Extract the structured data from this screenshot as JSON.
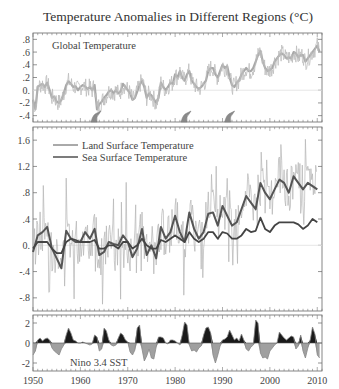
{
  "chart_data": [
    {
      "type": "line",
      "panel": "top",
      "title": "Temperature Anomalies in Different Regions (°C)",
      "label": "Global Temperature",
      "xlim": [
        1950,
        2011
      ],
      "ylim": [
        -0.5,
        0.9
      ],
      "yticks": [
        0.8,
        0.6,
        0.4,
        0.2,
        0.0,
        -0.2,
        -0.4
      ],
      "ytick_labels": [
        ".8",
        ".6",
        ".4",
        ".2",
        "0.",
        "-.2",
        "-.4"
      ],
      "zero_line": true,
      "volcano_markers": [
        1963.3,
        1982.3,
        1991.5
      ],
      "series": [
        {
          "name": "Global Temperature",
          "color": "#a8a8a8",
          "x": [
            1950,
            1950.5,
            1951,
            1951.5,
            1952,
            1952.5,
            1953,
            1953.5,
            1954,
            1954.5,
            1955,
            1955.5,
            1956,
            1956.5,
            1957,
            1957.5,
            1958,
            1958.5,
            1959,
            1959.5,
            1960,
            1960.5,
            1961,
            1961.5,
            1962,
            1962.5,
            1963,
            1963.5,
            1964,
            1964.5,
            1965,
            1965.5,
            1966,
            1966.5,
            1967,
            1967.5,
            1968,
            1968.5,
            1969,
            1969.5,
            1970,
            1970.5,
            1971,
            1971.5,
            1972,
            1972.5,
            1973,
            1973.5,
            1974,
            1974.5,
            1975,
            1975.5,
            1976,
            1976.5,
            1977,
            1977.5,
            1978,
            1978.5,
            1979,
            1979.5,
            1980,
            1980.5,
            1981,
            1981.5,
            1982,
            1982.5,
            1983,
            1983.5,
            1984,
            1984.5,
            1985,
            1985.5,
            1986,
            1986.5,
            1987,
            1987.5,
            1988,
            1988.5,
            1989,
            1989.5,
            1990,
            1990.5,
            1991,
            1991.5,
            1992,
            1992.5,
            1993,
            1993.5,
            1994,
            1994.5,
            1995,
            1995.5,
            1996,
            1996.5,
            1997,
            1997.5,
            1998,
            1998.5,
            1999,
            1999.5,
            2000,
            2000.5,
            2001,
            2001.5,
            2002,
            2002.5,
            2003,
            2003.5,
            2004,
            2004.5,
            2005,
            2005.5,
            2006,
            2006.5,
            2007,
            2007.5,
            2008,
            2008.5,
            2009,
            2009.5,
            2010,
            2010.5
          ],
          "values": [
            -0.15,
            -0.3,
            0.05,
            0.08,
            0.1,
            0.05,
            0.12,
            0.0,
            -0.12,
            -0.1,
            -0.18,
            -0.2,
            -0.15,
            -0.05,
            0.08,
            0.14,
            0.1,
            0.05,
            0.06,
            0.0,
            0.05,
            0.08,
            0.06,
            0.02,
            0.05,
            0.0,
            0.08,
            -0.3,
            -0.22,
            -0.18,
            -0.12,
            -0.08,
            -0.02,
            0.0,
            -0.05,
            0.0,
            -0.05,
            -0.02,
            0.1,
            0.05,
            0.0,
            -0.05,
            -0.15,
            -0.12,
            -0.02,
            0.08,
            0.15,
            0.05,
            -0.12,
            -0.05,
            -0.08,
            -0.14,
            -0.2,
            -0.12,
            0.12,
            0.05,
            0.0,
            0.05,
            0.12,
            0.1,
            0.25,
            0.2,
            0.3,
            0.2,
            0.15,
            0.25,
            0.3,
            0.15,
            0.1,
            0.05,
            0.02,
            0.05,
            0.1,
            0.15,
            0.3,
            0.35,
            0.35,
            0.25,
            0.2,
            0.3,
            0.4,
            0.35,
            0.38,
            0.2,
            0.08,
            0.05,
            0.12,
            0.15,
            0.25,
            0.3,
            0.35,
            0.3,
            0.3,
            0.35,
            0.45,
            0.55,
            0.62,
            0.45,
            0.35,
            0.3,
            0.32,
            0.35,
            0.45,
            0.5,
            0.55,
            0.58,
            0.55,
            0.5,
            0.52,
            0.5,
            0.6,
            0.58,
            0.52,
            0.55,
            0.55,
            0.45,
            0.5,
            0.55,
            0.6,
            0.65,
            0.7,
            0.6
          ]
        }
      ]
    },
    {
      "type": "line",
      "panel": "middle",
      "xlim": [
        1950,
        2011
      ],
      "ylim": [
        -1.0,
        1.8
      ],
      "yticks": [
        1.6,
        1.2,
        0.8,
        0.4,
        0.0,
        -0.4,
        -0.8
      ],
      "ytick_labels": [
        "1.6",
        "1.2",
        ".8",
        ".4",
        "0.",
        "-.4",
        "-.8"
      ],
      "zero_line": true,
      "legend": {
        "placement": "top-left",
        "entries": [
          "Land Surface Temperature",
          "Sea Surface Temperature"
        ]
      },
      "series": [
        {
          "name": "Land Surface Temperature (smoothed)",
          "color": "#555555",
          "x": [
            1950,
            1951,
            1952,
            1953,
            1954,
            1955,
            1956,
            1957,
            1958,
            1959,
            1960,
            1961,
            1962,
            1963,
            1964,
            1965,
            1966,
            1967,
            1968,
            1969,
            1970,
            1971,
            1972,
            1973,
            1974,
            1975,
            1976,
            1977,
            1978,
            1979,
            1980,
            1981,
            1982,
            1983,
            1984,
            1985,
            1986,
            1987,
            1988,
            1989,
            1990,
            1991,
            1992,
            1993,
            1994,
            1995,
            1996,
            1997,
            1998,
            1999,
            2000,
            2001,
            2002,
            2003,
            2004,
            2005,
            2006,
            2007,
            2008,
            2009,
            2010
          ],
          "values": [
            -0.1,
            0.15,
            0.2,
            0.28,
            -0.05,
            -0.2,
            -0.35,
            0.22,
            0.1,
            0.05,
            0.05,
            0.2,
            0.1,
            0.25,
            -0.15,
            -0.1,
            0.05,
            0.02,
            0.0,
            0.15,
            0.05,
            -0.18,
            -0.05,
            0.25,
            -0.15,
            0.0,
            -0.2,
            0.28,
            0.1,
            0.2,
            0.45,
            0.2,
            0.05,
            0.5,
            0.25,
            0.1,
            0.2,
            0.48,
            0.5,
            0.3,
            0.6,
            0.45,
            0.3,
            0.35,
            0.55,
            0.75,
            0.65,
            0.55,
            0.95,
            0.8,
            0.7,
            0.85,
            1.0,
            0.95,
            0.8,
            1.05,
            0.95,
            0.85,
            0.95,
            0.9,
            0.85
          ]
        },
        {
          "name": "Sea Surface Temperature (smoothed)",
          "color": "#444444",
          "x": [
            1950,
            1951,
            1952,
            1953,
            1954,
            1955,
            1956,
            1957,
            1958,
            1959,
            1960,
            1961,
            1962,
            1963,
            1964,
            1965,
            1966,
            1967,
            1968,
            1969,
            1970,
            1971,
            1972,
            1973,
            1974,
            1975,
            1976,
            1977,
            1978,
            1979,
            1980,
            1981,
            1982,
            1983,
            1984,
            1985,
            1986,
            1987,
            1988,
            1989,
            1990,
            1991,
            1992,
            1993,
            1994,
            1995,
            1996,
            1997,
            1998,
            1999,
            2000,
            2001,
            2002,
            2003,
            2004,
            2005,
            2006,
            2007,
            2008,
            2009,
            2010
          ],
          "values": [
            -0.05,
            0.05,
            0.05,
            0.05,
            -0.05,
            -0.12,
            -0.12,
            0.05,
            0.1,
            0.08,
            0.05,
            0.05,
            0.05,
            0.08,
            -0.05,
            -0.05,
            0.0,
            0.0,
            -0.05,
            0.05,
            0.05,
            -0.05,
            0.0,
            0.1,
            0.0,
            -0.05,
            -0.05,
            0.08,
            0.05,
            0.1,
            0.15,
            0.1,
            0.05,
            0.2,
            0.1,
            0.05,
            0.1,
            0.2,
            0.2,
            0.1,
            0.2,
            0.18,
            0.1,
            0.1,
            0.15,
            0.25,
            0.2,
            0.22,
            0.42,
            0.25,
            0.2,
            0.3,
            0.35,
            0.35,
            0.35,
            0.35,
            0.32,
            0.25,
            0.3,
            0.4,
            0.35
          ]
        }
      ]
    },
    {
      "type": "area",
      "panel": "bottom",
      "label": "Nino 3.4 SST",
      "xlim": [
        1950,
        2011
      ],
      "ylim": [
        -2.8,
        2.8
      ],
      "yticks": [
        2,
        0,
        -2
      ],
      "ytick_labels": [
        "2",
        "0",
        "-2"
      ],
      "xticks": [
        1950,
        1960,
        1970,
        1980,
        1990,
        2000,
        2010
      ],
      "xtick_labels": [
        "1950",
        "1960",
        "1970",
        "1980",
        "1990",
        "2000",
        "2010"
      ],
      "positive_color": "#1a1a1a",
      "negative_color": "#a0a0a0",
      "series": [
        {
          "name": "Nino 3.4 SST",
          "x": [
            1950,
            1950.5,
            1951,
            1951.5,
            1952,
            1952.5,
            1953,
            1953.5,
            1954,
            1954.5,
            1955,
            1955.5,
            1956,
            1956.5,
            1957,
            1957.5,
            1958,
            1958.5,
            1959,
            1959.5,
            1960,
            1960.5,
            1961,
            1961.5,
            1962,
            1962.5,
            1963,
            1963.5,
            1964,
            1964.5,
            1965,
            1965.5,
            1966,
            1966.5,
            1967,
            1967.5,
            1968,
            1968.5,
            1969,
            1969.5,
            1970,
            1970.5,
            1971,
            1971.5,
            1972,
            1972.5,
            1973,
            1973.5,
            1974,
            1974.5,
            1975,
            1975.5,
            1976,
            1976.5,
            1977,
            1977.5,
            1978,
            1978.5,
            1979,
            1979.5,
            1980,
            1980.5,
            1981,
            1981.5,
            1982,
            1982.5,
            1983,
            1983.5,
            1984,
            1984.5,
            1985,
            1985.5,
            1986,
            1986.5,
            1987,
            1987.5,
            1988,
            1988.5,
            1989,
            1989.5,
            1990,
            1990.5,
            1991,
            1991.5,
            1992,
            1992.5,
            1993,
            1993.5,
            1994,
            1994.5,
            1995,
            1995.5,
            1996,
            1996.5,
            1997,
            1997.5,
            1998,
            1998.5,
            1999,
            1999.5,
            2000,
            2000.5,
            2001,
            2001.5,
            2002,
            2002.5,
            2003,
            2003.5,
            2004,
            2004.5,
            2005,
            2005.5,
            2006,
            2006.5,
            2007,
            2007.5,
            2008,
            2008.5,
            2009,
            2009.5,
            2010,
            2010.5
          ],
          "values": [
            -1.2,
            -0.8,
            0.3,
            0.5,
            0.2,
            0.4,
            0.5,
            0.3,
            -0.5,
            -0.8,
            -1.0,
            -1.2,
            -0.6,
            -0.2,
            0.8,
            1.5,
            1.0,
            0.3,
            0.2,
            0.0,
            0.0,
            0.1,
            0.0,
            -0.1,
            -0.2,
            -0.1,
            0.8,
            0.6,
            -0.8,
            -0.6,
            1.5,
            1.2,
            0.3,
            -0.2,
            -0.3,
            -0.2,
            0.5,
            1.0,
            0.8,
            0.3,
            0.1,
            -0.9,
            -1.2,
            -0.7,
            1.5,
            1.8,
            -0.6,
            -1.8,
            -1.3,
            -0.6,
            -1.5,
            -1.6,
            -0.4,
            0.6,
            0.6,
            0.5,
            0.0,
            -0.1,
            0.3,
            0.3,
            0.2,
            0.0,
            -0.2,
            0.8,
            2.1,
            1.8,
            -0.2,
            -0.8,
            -0.7,
            -0.9,
            -0.5,
            -0.3,
            0.8,
            1.5,
            1.6,
            1.0,
            -1.2,
            -2.0,
            -1.2,
            -0.3,
            0.3,
            0.4,
            0.6,
            1.3,
            0.8,
            0.3,
            0.5,
            0.2,
            0.9,
            0.3,
            -0.6,
            -0.8,
            -0.4,
            -0.2,
            2.3,
            2.0,
            -1.0,
            -1.5,
            -1.4,
            -1.6,
            -0.8,
            -0.5,
            -0.2,
            0.0,
            1.1,
            0.8,
            0.5,
            0.3,
            0.5,
            0.7,
            0.6,
            -0.6,
            -0.3,
            0.8,
            -0.8,
            -1.5,
            -0.5,
            0.3,
            1.6,
            0.9,
            -1.2,
            -1.5
          ]
        }
      ]
    }
  ]
}
